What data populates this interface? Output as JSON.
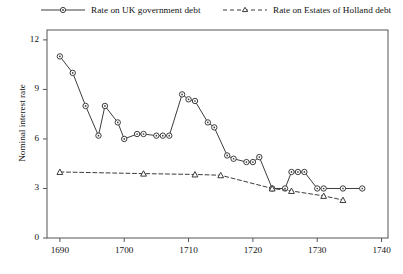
{
  "chart_data": {
    "type": "line",
    "title": "",
    "xlabel": "",
    "ylabel": "Nominal interest rate",
    "xlim": [
      1688,
      1741
    ],
    "ylim": [
      0,
      12.6
    ],
    "grid": false,
    "legend_position": "top",
    "xticks": [
      1690,
      1700,
      1710,
      1720,
      1730,
      1740
    ],
    "yticks": [
      0,
      3,
      6,
      9,
      12
    ],
    "series": [
      {
        "name": "Rate on UK government debt",
        "marker": "circle",
        "linestyle": "solid",
        "color": "#3c3c3c",
        "points": [
          [
            1690,
            11.0
          ],
          [
            1692,
            10.0
          ],
          [
            1694,
            8.0
          ],
          [
            1696,
            6.2
          ],
          [
            1697,
            8.0
          ],
          [
            1699,
            7.0
          ],
          [
            1700,
            6.0
          ],
          [
            1702,
            6.3
          ],
          [
            1703,
            6.3
          ],
          [
            1705,
            6.2
          ],
          [
            1706,
            6.2
          ],
          [
            1707,
            6.2
          ],
          [
            1709,
            8.7
          ],
          [
            1710,
            8.4
          ],
          [
            1711,
            8.3
          ],
          [
            1713,
            7.0
          ],
          [
            1714,
            6.7
          ],
          [
            1716,
            5.0
          ],
          [
            1717,
            4.8
          ],
          [
            1719,
            4.6
          ],
          [
            1720,
            4.6
          ],
          [
            1721,
            4.9
          ],
          [
            1723,
            3.0
          ],
          [
            1725,
            3.0
          ],
          [
            1726,
            4.0
          ],
          [
            1727,
            4.0
          ],
          [
            1728,
            4.0
          ],
          [
            1730,
            3.0
          ],
          [
            1731,
            3.0
          ],
          [
            1734,
            3.0
          ],
          [
            1737,
            3.0
          ]
        ]
      },
      {
        "name": "Rate on Estates of Holland debt",
        "marker": "triangle",
        "linestyle": "dashed",
        "color": "#3c3c3c",
        "points": [
          [
            1690,
            4.0
          ],
          [
            1703,
            3.9
          ],
          [
            1711,
            3.85
          ],
          [
            1715,
            3.8
          ],
          [
            1723,
            3.0
          ],
          [
            1726,
            2.85
          ],
          [
            1731,
            2.55
          ],
          [
            1734,
            2.3
          ]
        ]
      }
    ]
  },
  "legend": {
    "entries": [
      {
        "label": "Rate on UK government debt"
      },
      {
        "label": "Rate on Estates of Holland debt"
      }
    ]
  },
  "axes": {
    "ylabel": "Nominal interest rate",
    "ytick_labels": [
      "0",
      "3",
      "6",
      "9",
      "12"
    ],
    "xtick_labels": [
      "1690",
      "1700",
      "1710",
      "1720",
      "1730",
      "1740"
    ]
  }
}
